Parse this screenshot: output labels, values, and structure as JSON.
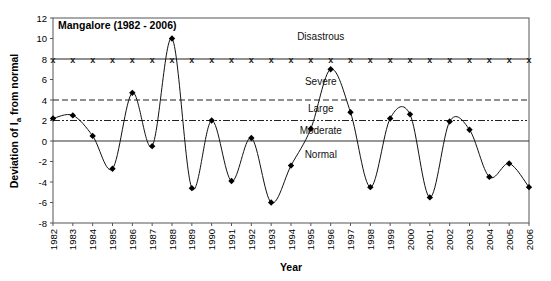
{
  "chart_data": {
    "type": "line",
    "title": "Mangalore (1982 - 2006)",
    "xlabel": "Year",
    "ylabel": "Deviation of I a from normal",
    "ylabel_main": "Deviation of I",
    "ylabel_sub": "a",
    "ylabel_tail": " from normal",
    "ylim": [
      -8,
      12
    ],
    "yticks": [
      -8,
      -6,
      -4,
      -2,
      0,
      2,
      4,
      6,
      8,
      10,
      12
    ],
    "grid": false,
    "categories": [
      "1982",
      "1983",
      "1984",
      "1985",
      "1986",
      "1987",
      "1988",
      "1989",
      "1990",
      "1991",
      "1992",
      "1993",
      "1994",
      "1995",
      "1996",
      "1997",
      "1998",
      "1999",
      "2000",
      "2001",
      "2002",
      "2003",
      "2004",
      "2005",
      "2006"
    ],
    "series": [
      {
        "name": "Deviation of Ia",
        "marker": "diamond",
        "smooth": true,
        "values": [
          2.2,
          2.5,
          0.5,
          -2.7,
          4.7,
          -0.5,
          10.0,
          -4.6,
          2.0,
          -3.9,
          0.3,
          -6.0,
          -2.4,
          1.2,
          7.0,
          2.8,
          -4.5,
          2.2,
          2.6,
          -5.5,
          1.9,
          1.1,
          -3.5,
          -2.2,
          -4.5
        ]
      }
    ],
    "thresholds": [
      {
        "name": "Disastrous threshold",
        "value": 8,
        "style": "x-marker"
      },
      {
        "name": "Severe threshold",
        "value": 4,
        "style": "dashed"
      },
      {
        "name": "Large threshold",
        "value": 2,
        "style": "dash-dot-dot"
      },
      {
        "name": "Normal baseline",
        "value": 0,
        "style": "solid"
      }
    ],
    "zone_labels": [
      {
        "label": "Disastrous",
        "y": 10.1,
        "x_year": 1995.5
      },
      {
        "label": "Severe",
        "y": 5.8,
        "x_year": 1995.5
      },
      {
        "label": "Large",
        "y": 3.1,
        "x_year": 1995.5
      },
      {
        "label": "Moderate",
        "y": 1.0,
        "x_year": 1995.5
      },
      {
        "label": "Normal",
        "y": -1.4,
        "x_year": 1995.5
      }
    ]
  }
}
